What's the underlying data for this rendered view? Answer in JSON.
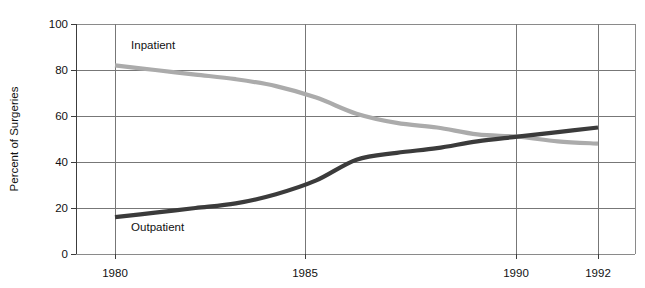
{
  "chart_data": {
    "type": "line",
    "title": "",
    "xlabel": "",
    "ylabel": "Percent of Surgeries",
    "xlim": [
      1979,
      1993
    ],
    "ylim": [
      0,
      100
    ],
    "grid": true,
    "legend_position": "inline-annotation",
    "x_ticks": [
      "1980",
      "1985",
      "1990",
      "1992"
    ],
    "x_tick_values": [
      1980,
      1985,
      1990,
      1992
    ],
    "y_ticks": [
      "0",
      "20",
      "40",
      "60",
      "80",
      "100"
    ],
    "y_tick_values": [
      0,
      20,
      40,
      60,
      80,
      100
    ],
    "x": [
      1980,
      1981,
      1982,
      1983,
      1984,
      1985,
      1986,
      1987,
      1988,
      1989,
      1990,
      1991,
      1992
    ],
    "series": [
      {
        "name": "Inpatient",
        "color": "#ababab",
        "label": "Inpatient",
        "values": [
          82,
          80,
          78,
          76,
          73,
          68,
          61,
          57,
          55,
          52,
          51,
          49,
          48
        ]
      },
      {
        "name": "Outpatient",
        "color": "#3b3b3b",
        "label": "Outpatient",
        "values": [
          16,
          18,
          20,
          22,
          26,
          32,
          41,
          44,
          46,
          49,
          51,
          53,
          55
        ]
      }
    ],
    "annotations": [
      {
        "text": "Inpatient",
        "x": 1980.4,
        "y": 89
      },
      {
        "text": "Outpatient",
        "x": 1980.4,
        "y": 10
      }
    ]
  },
  "colors": {
    "inpatient": "#ababab",
    "outpatient": "#3b3b3b",
    "grid": "#777777",
    "axis": "#3c3c3c",
    "background": "#ffffff"
  }
}
